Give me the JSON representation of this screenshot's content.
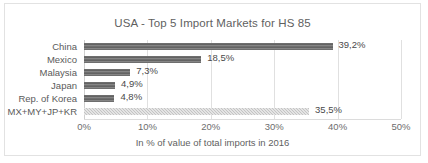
{
  "chart_data": {
    "type": "bar",
    "orientation": "horizontal",
    "title": "USA - Top 5 Import Markets for HS 85",
    "xlabel": "In % of value of total imports in 2016",
    "ylabel": "",
    "categories": [
      "China",
      "Mexico",
      "Malaysia",
      "Japan",
      "Rep. of Korea",
      "MX+MY+JP+KR"
    ],
    "values": [
      39.2,
      18.5,
      7.3,
      4.9,
      4.8,
      35.5
    ],
    "data_labels": [
      "39,2%",
      "18,5%",
      "7,3%",
      "4,9%",
      "4,8%",
      "35,5%"
    ],
    "xlim": [
      0,
      50
    ],
    "xticks": [
      0,
      10,
      20,
      30,
      40,
      50
    ],
    "xtick_labels": [
      "0%",
      "10%",
      "20%",
      "30%",
      "40%",
      "50%"
    ],
    "grid": "vertical",
    "legend": "none",
    "series": [
      {
        "name": "Share of total imports",
        "values": [
          39.2,
          18.5,
          7.3,
          4.9,
          4.8,
          35.5
        ]
      }
    ],
    "bar_colors": [
      "#6e6e6e",
      "#6e6e6e",
      "#6e6e6e",
      "#6e6e6e",
      "#6e6e6e",
      "#c4c4c4"
    ],
    "colors": {
      "bar_dark": "#6e6e6e",
      "bar_light": "#c4c4c4",
      "gridline": "#e0e0e0",
      "text": "#595959",
      "frame_border": "#e2e2e2",
      "background": "#ffffff"
    }
  }
}
